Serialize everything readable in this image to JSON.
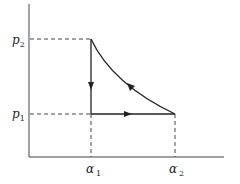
{
  "diagram": {
    "type": "p-alpha cycle diagram",
    "y_axis": {
      "labels": [
        {
          "main": "p",
          "sub": "2"
        },
        {
          "main": "p",
          "sub": "1"
        }
      ]
    },
    "x_axis": {
      "labels": [
        {
          "main": "α",
          "sub": "1"
        },
        {
          "main": "α",
          "sub": "2"
        }
      ]
    },
    "paths": [
      {
        "name": "isochoric-cooling",
        "from": "(α1,p2)",
        "to": "(α1,p1)",
        "direction": "down"
      },
      {
        "name": "isobaric-expansion",
        "from": "(α1,p1)",
        "to": "(α2,p1)",
        "direction": "right"
      },
      {
        "name": "compression-curve",
        "from": "(α2,p1)",
        "to": "(α1,p2)",
        "direction": "up-left"
      }
    ],
    "colors": {
      "line": "#333333",
      "background": "#ffffff"
    }
  }
}
